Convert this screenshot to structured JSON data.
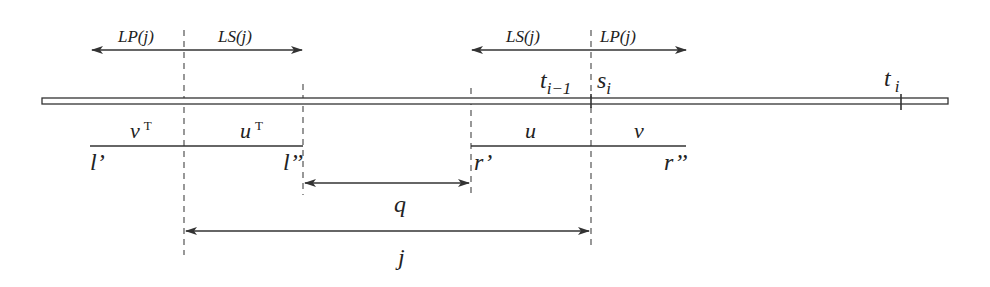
{
  "diagram": {
    "top_arrows": {
      "left_group": {
        "left_label": "LP(j)",
        "right_label": "LS(j)"
      },
      "right_group": {
        "left_label": "LS(j)",
        "right_label": "LP(j)"
      }
    },
    "bar_labels": {
      "t_i_minus_1": {
        "base": "t",
        "sub": "i−1"
      },
      "s_i": {
        "base": "s",
        "sub": "i"
      },
      "t_i": {
        "base": "t",
        "sub": "i"
      }
    },
    "segments": {
      "left": {
        "left_word": "v",
        "left_sup": "T",
        "right_word": "u",
        "right_sup": "T",
        "start": "l’",
        "end": "l’’"
      },
      "right": {
        "left_word": "u",
        "right_word": "v",
        "start": "r’",
        "end": "r’’"
      }
    },
    "distances": {
      "q": "q",
      "j": "j"
    }
  }
}
